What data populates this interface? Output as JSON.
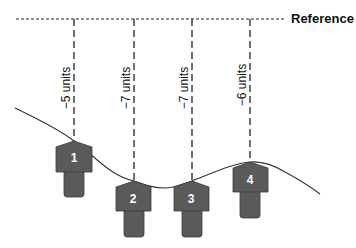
{
  "reference": {
    "label": "Reference"
  },
  "colors": {
    "shape_fill": "#5a5a5a",
    "shape_stroke": "#3a3a3a",
    "line": "#222222",
    "curve": "#333333",
    "number_text": "#ffffff"
  },
  "measurements": [
    {
      "id": 1,
      "number": "1",
      "label": "−5 units",
      "value": -5
    },
    {
      "id": 2,
      "number": "2",
      "label": "−7 units",
      "value": -7
    },
    {
      "id": 3,
      "number": "3",
      "label": "−7 units",
      "value": -7
    },
    {
      "id": 4,
      "number": "4",
      "label": "−6 units",
      "value": -6
    }
  ]
}
